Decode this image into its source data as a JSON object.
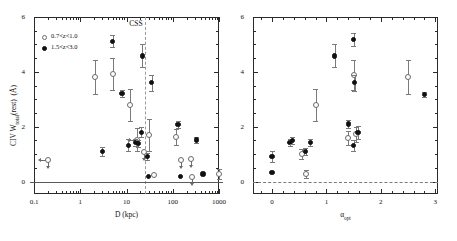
{
  "figure": {
    "panels": [
      {
        "id": "left",
        "annotation": "CSS"
      },
      {
        "id": "right",
        "annotation": ""
      }
    ],
    "legend": {
      "entries": [
        {
          "marker": "open-circle",
          "label": "0.7<z<1.0"
        },
        {
          "marker": "filled-circle",
          "label": "1.5<z<3.0"
        }
      ]
    },
    "colors": {
      "filled": "#111111",
      "open": "#6a6a6a",
      "errorbar": "#7a7a7a",
      "frame": "#2a2a2a",
      "dashed": "#9a9a9a"
    }
  },
  "chart_data": [
    {
      "type": "scatter",
      "id": "left-panel",
      "title": "",
      "xlabel": "D (kpc)",
      "ylabel": "CIV W_total(rest)  (Å)",
      "xscale": "log",
      "xlim": [
        0.1,
        1000
      ],
      "ylim": [
        -0.45,
        6
      ],
      "xticks": [
        0.1,
        1,
        10,
        100,
        1000
      ],
      "xticklabels": [
        "0.1",
        "1",
        "10",
        "100",
        "1000"
      ],
      "yticks": [
        0,
        2,
        4,
        6
      ],
      "yticklabels": [
        "0",
        "2",
        "4",
        "6"
      ],
      "grid": false,
      "annotations": [
        {
          "text": "CSS",
          "x": 16,
          "y": 5.75
        },
        {
          "type": "vline",
          "x": 25,
          "style": "dashed"
        },
        {
          "type": "hline",
          "y": 0,
          "style": "solid"
        }
      ],
      "series": [
        {
          "name": "0.7<z<1.0",
          "marker": "open-circle",
          "points": [
            {
              "x": 0.2,
              "y": 0.78,
              "yerr": 0.0,
              "limit": "left-down"
            },
            {
              "x": 2.1,
              "y": 3.82,
              "yerr": 0.62
            },
            {
              "x": 5.0,
              "y": 3.92,
              "yerr": 0.58
            },
            {
              "x": 12.0,
              "y": 2.78,
              "yerr": 0.58
            },
            {
              "x": 17.0,
              "y": 1.52,
              "yerr": 0.42,
              "limit": "left"
            },
            {
              "x": 24.0,
              "y": 1.08,
              "yerr": 0.0,
              "limit": "down"
            },
            {
              "x": 31.0,
              "y": 1.7,
              "yerr": 0.6
            },
            {
              "x": 40.0,
              "y": 0.25,
              "yerr": 0.0
            },
            {
              "x": 120.0,
              "y": 1.62,
              "yerr": 0.3
            },
            {
              "x": 150.0,
              "y": 0.8,
              "yerr": 0.0,
              "limit": "down"
            },
            {
              "x": 250.0,
              "y": 0.82,
              "yerr": 0.0,
              "limit": "down"
            },
            {
              "x": 260.0,
              "y": 0.18,
              "yerr": 0.0,
              "limit": "down"
            },
            {
              "x": 1000.0,
              "y": 0.28,
              "yerr": 0.18
            }
          ]
        },
        {
          "name": "1.5<z<3.0",
          "marker": "filled-circle",
          "points": [
            {
              "x": 3.0,
              "y": 1.1,
              "yerr": 0.18
            },
            {
              "x": 5.0,
              "y": 5.12,
              "yerr": 0.22
            },
            {
              "x": 8.0,
              "y": 3.22,
              "yerr": 0.12
            },
            {
              "x": 11.0,
              "y": 1.32,
              "yerr": 0.22
            },
            {
              "x": 16.0,
              "y": 1.42,
              "yerr": 0.12
            },
            {
              "x": 18.0,
              "y": 1.4,
              "yerr": 0.12
            },
            {
              "x": 21.0,
              "y": 1.8,
              "yerr": 0.18
            },
            {
              "x": 22.0,
              "y": 4.58,
              "yerr": 0.42
            },
            {
              "x": 28.0,
              "y": 0.92,
              "yerr": 0.14
            },
            {
              "x": 30.0,
              "y": 0.18,
              "yerr": 0.0
            },
            {
              "x": 35.0,
              "y": 3.6,
              "yerr": 0.28
            },
            {
              "x": 130.0,
              "y": 2.08,
              "yerr": 0.14
            },
            {
              "x": 145.0,
              "y": 0.18,
              "yerr": 0.0
            },
            {
              "x": 320.0,
              "y": 1.52,
              "yerr": 0.1
            },
            {
              "x": 450.0,
              "y": 0.28,
              "yerr": 0.0
            }
          ]
        }
      ]
    },
    {
      "type": "scatter",
      "id": "right-panel",
      "title": "",
      "xlabel": "α_opt",
      "ylabel": "",
      "xscale": "linear",
      "xlim": [
        -0.35,
        3.05
      ],
      "ylim": [
        -0.45,
        6
      ],
      "xticks": [
        0,
        1,
        2,
        3
      ],
      "xticklabels": [
        "0",
        "1",
        "2",
        "3"
      ],
      "yticks": [
        0,
        2,
        4,
        6
      ],
      "yticklabels": [
        "0",
        "2",
        "4",
        "6"
      ],
      "grid": false,
      "annotations": [
        {
          "type": "hline",
          "y": 0,
          "style": "dashed"
        }
      ],
      "series": [
        {
          "name": "0.7<z<1.0",
          "marker": "open-circle",
          "points": [
            {
              "x": 0.55,
              "y": 1.0,
              "yerr": 0.18
            },
            {
              "x": 0.63,
              "y": 0.28,
              "yerr": 0.16
            },
            {
              "x": 0.8,
              "y": 2.78,
              "yerr": 0.58
            },
            {
              "x": 1.4,
              "y": 1.6,
              "yerr": 0.26
            },
            {
              "x": 1.5,
              "y": 3.9,
              "yerr": 0.55
            },
            {
              "x": 1.55,
              "y": 1.72,
              "yerr": 0.28
            },
            {
              "x": 2.5,
              "y": 3.8,
              "yerr": 0.62
            }
          ]
        },
        {
          "name": "1.5<z<3.0",
          "marker": "filled-circle",
          "points": [
            {
              "x": 0.0,
              "y": 0.92,
              "yerr": 0.2
            },
            {
              "x": 0.0,
              "y": 0.32,
              "yerr": 0.0
            },
            {
              "x": 0.33,
              "y": 1.42,
              "yerr": 0.12
            },
            {
              "x": 0.37,
              "y": 1.5,
              "yerr": 0.12
            },
            {
              "x": 0.62,
              "y": 1.1,
              "yerr": 0.14
            },
            {
              "x": 0.7,
              "y": 1.42,
              "yerr": 0.12
            },
            {
              "x": 1.15,
              "y": 4.58,
              "yerr": 0.42
            },
            {
              "x": 1.4,
              "y": 2.1,
              "yerr": 0.16
            },
            {
              "x": 1.5,
              "y": 5.18,
              "yerr": 0.22
            },
            {
              "x": 1.5,
              "y": 1.32,
              "yerr": 0.2
            },
            {
              "x": 1.52,
              "y": 3.6,
              "yerr": 0.28
            },
            {
              "x": 1.58,
              "y": 1.8,
              "yerr": 0.24
            },
            {
              "x": 2.8,
              "y": 3.18,
              "yerr": 0.1
            }
          ]
        }
      ]
    }
  ]
}
